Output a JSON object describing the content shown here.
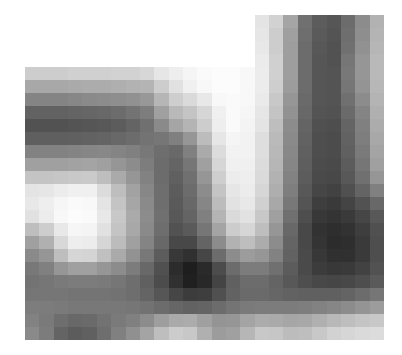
{
  "figure": {
    "type": "grayscale-pixel-matrix",
    "rows": 25,
    "cols": 25,
    "background": "#ffffff",
    "note_scale": "0 = black, 255 = white",
    "matrix": [
      [
        255,
        255,
        255,
        255,
        255,
        255,
        255,
        255,
        255,
        255,
        255,
        255,
        255,
        255,
        255,
        255,
        228,
        210,
        165,
        112,
        92,
        86,
        108,
        140,
        178
      ],
      [
        255,
        255,
        255,
        255,
        255,
        255,
        255,
        255,
        255,
        255,
        255,
        255,
        255,
        255,
        255,
        255,
        230,
        205,
        160,
        110,
        90,
        84,
        110,
        142,
        180
      ],
      [
        255,
        255,
        255,
        255,
        255,
        255,
        255,
        255,
        255,
        255,
        255,
        255,
        255,
        255,
        255,
        255,
        232,
        205,
        158,
        108,
        88,
        82,
        112,
        145,
        182
      ],
      [
        255,
        255,
        255,
        255,
        255,
        255,
        255,
        255,
        255,
        255,
        255,
        255,
        255,
        255,
        255,
        255,
        235,
        208,
        158,
        108,
        86,
        82,
        118,
        150,
        185
      ],
      [
        205,
        205,
        205,
        208,
        208,
        208,
        210,
        210,
        215,
        230,
        238,
        245,
        250,
        252,
        252,
        248,
        236,
        208,
        158,
        108,
        86,
        84,
        120,
        150,
        185
      ],
      [
        168,
        168,
        168,
        170,
        172,
        172,
        175,
        178,
        180,
        205,
        225,
        240,
        248,
        252,
        252,
        248,
        236,
        206,
        156,
        108,
        86,
        84,
        118,
        148,
        183
      ],
      [
        132,
        132,
        132,
        135,
        138,
        140,
        142,
        145,
        152,
        182,
        206,
        218,
        232,
        248,
        250,
        248,
        234,
        200,
        150,
        106,
        86,
        84,
        112,
        140,
        180
      ],
      [
        98,
        98,
        98,
        100,
        102,
        104,
        108,
        115,
        125,
        160,
        185,
        196,
        214,
        240,
        250,
        246,
        230,
        196,
        146,
        104,
        84,
        82,
        106,
        132,
        176
      ],
      [
        82,
        82,
        82,
        84,
        86,
        88,
        92,
        100,
        112,
        138,
        165,
        180,
        205,
        238,
        250,
        244,
        228,
        190,
        140,
        100,
        80,
        78,
        100,
        128,
        172
      ],
      [
        95,
        95,
        95,
        96,
        98,
        100,
        104,
        108,
        115,
        118,
        128,
        150,
        188,
        230,
        245,
        242,
        222,
        186,
        138,
        98,
        78,
        76,
        98,
        126,
        168
      ],
      [
        130,
        130,
        130,
        132,
        134,
        136,
        132,
        128,
        120,
        110,
        105,
        128,
        170,
        220,
        242,
        242,
        222,
        184,
        136,
        96,
        78,
        76,
        96,
        122,
        164
      ],
      [
        160,
        160,
        160,
        162,
        164,
        160,
        150,
        140,
        125,
        108,
        100,
        118,
        160,
        214,
        240,
        240,
        220,
        182,
        134,
        94,
        76,
        74,
        92,
        118,
        160
      ],
      [
        196,
        196,
        198,
        200,
        202,
        190,
        170,
        150,
        130,
        108,
        96,
        112,
        150,
        206,
        236,
        238,
        218,
        178,
        130,
        92,
        74,
        72,
        88,
        112,
        150
      ],
      [
        228,
        230,
        236,
        240,
        240,
        220,
        190,
        162,
        135,
        110,
        92,
        108,
        140,
        196,
        230,
        236,
        214,
        174,
        126,
        88,
        70,
        66,
        80,
        100,
        128
      ],
      [
        232,
        238,
        246,
        250,
        248,
        228,
        196,
        166,
        138,
        110,
        90,
        104,
        134,
        188,
        226,
        232,
        208,
        168,
        120,
        84,
        62,
        58,
        68,
        82,
        104
      ],
      [
        225,
        236,
        248,
        252,
        250,
        232,
        200,
        170,
        140,
        112,
        88,
        100,
        128,
        180,
        218,
        226,
        200,
        160,
        112,
        78,
        56,
        52,
        58,
        70,
        88
      ],
      [
        190,
        205,
        232,
        246,
        244,
        225,
        196,
        168,
        138,
        110,
        82,
        90,
        118,
        164,
        204,
        214,
        190,
        150,
        104,
        72,
        50,
        46,
        50,
        62,
        80
      ],
      [
        160,
        176,
        216,
        238,
        236,
        214,
        188,
        160,
        132,
        104,
        72,
        72,
        100,
        140,
        178,
        190,
        172,
        140,
        100,
        72,
        52,
        44,
        46,
        58,
        78
      ],
      [
        138,
        150,
        190,
        214,
        212,
        192,
        170,
        146,
        120,
        92,
        56,
        48,
        70,
        108,
        140,
        156,
        150,
        130,
        98,
        74,
        56,
        48,
        48,
        58,
        78
      ],
      [
        120,
        128,
        150,
        160,
        160,
        150,
        140,
        124,
        104,
        80,
        44,
        30,
        42,
        76,
        108,
        124,
        124,
        112,
        92,
        74,
        60,
        56,
        58,
        66,
        82
      ],
      [
        115,
        118,
        122,
        124,
        124,
        122,
        118,
        110,
        96,
        76,
        48,
        32,
        40,
        68,
        96,
        108,
        108,
        100,
        88,
        78,
        72,
        70,
        72,
        78,
        90
      ],
      [
        118,
        118,
        118,
        116,
        116,
        116,
        114,
        110,
        100,
        86,
        70,
        60,
        62,
        80,
        98,
        106,
        106,
        102,
        98,
        96,
        96,
        96,
        100,
        108,
        118
      ],
      [
        125,
        124,
        122,
        120,
        120,
        120,
        120,
        118,
        114,
        108,
        102,
        98,
        100,
        108,
        116,
        122,
        124,
        124,
        124,
        126,
        130,
        134,
        140,
        148,
        156
      ],
      [
        130,
        122,
        110,
        104,
        106,
        114,
        122,
        128,
        140,
        158,
        170,
        172,
        160,
        148,
        150,
        164,
        172,
        170,
        166,
        168,
        176,
        184,
        190,
        196,
        200
      ],
      [
        138,
        124,
        100,
        92,
        96,
        110,
        128,
        144,
        164,
        190,
        204,
        200,
        176,
        156,
        160,
        182,
        200,
        198,
        188,
        190,
        200,
        210,
        214,
        218,
        220
      ]
    ]
  }
}
